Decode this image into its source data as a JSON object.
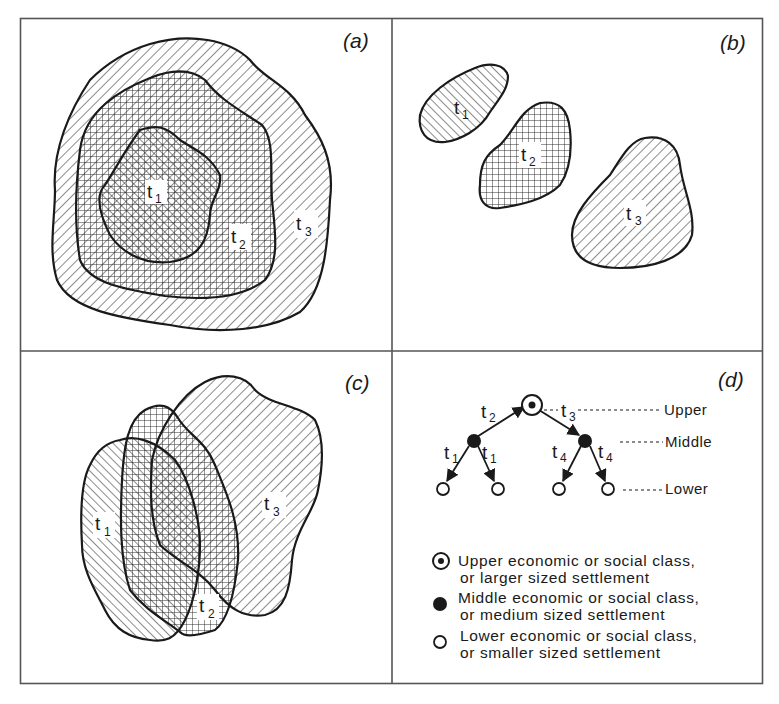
{
  "figure": {
    "panels": [
      {
        "id": "a",
        "label": "(a)",
        "regions": [
          {
            "label": "t",
            "sub": "1",
            "pattern": "hatch-back"
          },
          {
            "label": "t",
            "sub": "2",
            "pattern": "grid"
          },
          {
            "label": "t",
            "sub": "3",
            "pattern": "hatch-forward"
          }
        ]
      },
      {
        "id": "b",
        "label": "(b)",
        "regions": [
          {
            "label": "t",
            "sub": "1",
            "pattern": "hatch-back"
          },
          {
            "label": "t",
            "sub": "2",
            "pattern": "grid"
          },
          {
            "label": "t",
            "sub": "3",
            "pattern": "hatch-forward"
          }
        ]
      },
      {
        "id": "c",
        "label": "(c)",
        "regions": [
          {
            "label": "t",
            "sub": "1",
            "pattern": "hatch-back"
          },
          {
            "label": "t",
            "sub": "2",
            "pattern": "grid"
          },
          {
            "label": "t",
            "sub": "3",
            "pattern": "hatch-forward"
          }
        ]
      },
      {
        "id": "d",
        "label": "(d)"
      }
    ],
    "hierarchy": {
      "edges": {
        "up_left": {
          "label": "t",
          "sub": "2"
        },
        "up_right": {
          "label": "t",
          "sub": "3"
        },
        "left_a": {
          "label": "t",
          "sub": "1"
        },
        "left_b": {
          "label": "t",
          "sub": "1"
        },
        "right_a": {
          "label": "t",
          "sub": "4"
        },
        "right_b": {
          "label": "t",
          "sub": "4"
        }
      },
      "levels": {
        "upper": "Upper",
        "middle": "Middle",
        "lower": "Lower"
      }
    },
    "legend": [
      {
        "symbol": "circled-dot",
        "line1": "Upper economic or social class,",
        "line2": "or larger sized settlement"
      },
      {
        "symbol": "filled-circle",
        "line1": "Middle economic or social class,",
        "line2": "or medium sized settlement"
      },
      {
        "symbol": "open-circle",
        "line1": "Lower economic or social class,",
        "line2": "or smaller sized settlement"
      }
    ],
    "colors": {
      "ink": "#1a1a1a",
      "paper": "#ffffff"
    }
  }
}
